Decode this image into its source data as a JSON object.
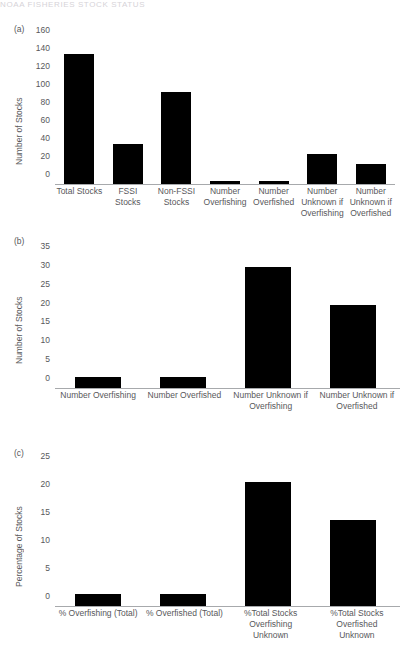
{
  "header": {
    "running_head": "NOAA FISHERIES STOCK STATUS"
  },
  "chart_data": [
    {
      "type": "bar",
      "panel": "(a)",
      "title": "",
      "xlabel": "",
      "ylabel": "Number of Stocks",
      "ylim": [
        0,
        160
      ],
      "yticks": [
        0,
        20,
        40,
        60,
        80,
        100,
        120,
        140,
        160
      ],
      "grid": false,
      "legend": "none",
      "bar_color": "#000000",
      "categories": [
        "Total Stocks",
        "FSSI Stocks",
        "Non-FSSI Stocks",
        "Number Overfishing",
        "Number Overfished",
        "Number Unknown if Overfishing",
        "Number Unknown if Overfished"
      ],
      "values": [
        145,
        44,
        102,
        3,
        3,
        33,
        22
      ]
    },
    {
      "type": "bar",
      "panel": "(b)",
      "title": "",
      "xlabel": "",
      "ylabel": "Number of Stocks",
      "ylim": [
        0,
        35
      ],
      "yticks": [
        0,
        5,
        10,
        15,
        20,
        25,
        30,
        35
      ],
      "grid": false,
      "legend": "none",
      "bar_color": "#000000",
      "categories": [
        "Number Overfishing",
        "Number Overfished",
        "Number Unknown if Overfishing",
        "Number Unknown if Overfished"
      ],
      "values": [
        3,
        3,
        32,
        22
      ]
    },
    {
      "type": "bar",
      "panel": "(c)",
      "title": "",
      "xlabel": "",
      "ylabel": "Percentage of Stocks",
      "ylim": [
        0,
        25
      ],
      "yticks": [
        0,
        5,
        10,
        15,
        20,
        25
      ],
      "grid": false,
      "legend": "none",
      "bar_color": "#000000",
      "categories": [
        "% Overfishing (Total)",
        "% Overfished (Total)",
        "%Total Stocks Overfishing Unknown",
        "%Total Stocks Overfished Unknown"
      ],
      "values": [
        2.1,
        2.1,
        22.2,
        15.3
      ]
    }
  ],
  "panel_a": {
    "tag": "(a)",
    "ylabel": "Number of Stocks",
    "yticks": [
      "160",
      "140",
      "120",
      "100",
      "80",
      "60",
      "40",
      "20",
      "0"
    ],
    "xlabels": [
      "Total Stocks",
      "FSSI Stocks",
      "Non-FSSI\nStocks",
      "Number\nOverfishing",
      "Number\nOverfished",
      "Number\nUnknown if\nOverfishing",
      "Number\nUnknown if\nOverfished"
    ]
  },
  "panel_b": {
    "tag": "(b)",
    "ylabel": "Number of Stocks",
    "yticks": [
      "35",
      "30",
      "25",
      "20",
      "15",
      "10",
      "5",
      "0"
    ],
    "xlabels": [
      "Number Overfishing",
      "Number Overfished",
      "Number Unknown if\nOverfishing",
      "Number Unknown if\nOverfished"
    ]
  },
  "panel_c": {
    "tag": "(c)",
    "ylabel": "Percentage of Stocks",
    "yticks": [
      "25",
      "20",
      "15",
      "10",
      "5",
      "0"
    ],
    "xlabels": [
      "% Overfishing (Total)",
      "% Overfished (Total)",
      "%Total Stocks\nOverfishing\nUnknown",
      "%Total Stocks\nOverfished\nUnknown"
    ]
  }
}
